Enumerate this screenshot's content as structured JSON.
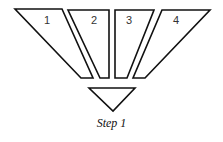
{
  "diagram": {
    "pieces": [
      {
        "label": "1",
        "points": "15,9 62,9 93,78 81,78",
        "label_x": 47,
        "label_y": 15
      },
      {
        "label": "2",
        "points": "68,10 109,10 109,78 100,78",
        "label_x": 94,
        "label_y": 15
      },
      {
        "label": "3",
        "points": "115,10 154,10 127,78 115,78",
        "label_x": 129,
        "label_y": 15
      },
      {
        "label": "4",
        "points": "162,10 210,10 145,78 133,78",
        "label_x": 176,
        "label_y": 15
      }
    ],
    "bottom_triangle": {
      "points": "89,88 135,88 113,111"
    },
    "caption": "Step 1",
    "colors": {
      "stroke": "#111111",
      "fill": "#ffffff",
      "background": "#ffffff"
    }
  }
}
